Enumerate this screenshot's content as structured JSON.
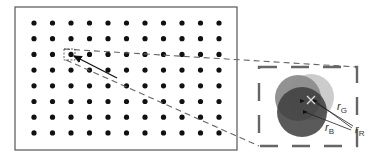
{
  "figure": {
    "type": "chromatic-aberration-spot-diagram",
    "grid": {
      "rows": 8,
      "cols": 11,
      "origin": [
        34,
        23
      ],
      "spacing": [
        18.5,
        15.7
      ],
      "dot_radius": 2.6,
      "dot_color": "#111111",
      "frame": {
        "x": 15,
        "y": 7,
        "width": 222,
        "height": 143,
        "stroke": "#555555"
      }
    },
    "highlight": {
      "box": {
        "x": 64,
        "y": 49,
        "width": 11,
        "height": 11
      },
      "arrow": {
        "from": [
          117,
          78
        ],
        "to": [
          74,
          56
        ]
      }
    },
    "inset": {
      "box": {
        "x": 259,
        "y": 67,
        "width": 98,
        "height": 79,
        "stroke": "#666666"
      },
      "circles": [
        {
          "name": "G",
          "cx": 311,
          "cy": 97,
          "r": 23,
          "fill": "#c9c9c9"
        },
        {
          "name": "R",
          "cx": 298,
          "cy": 98,
          "r": 23,
          "fill": "#8c8c8c"
        },
        {
          "name": "B",
          "cx": 302,
          "cy": 112,
          "r": 25,
          "fill": "#3d3d3d"
        }
      ],
      "labels": [
        {
          "base": "r",
          "sub": "G",
          "x": 337,
          "y": 110
        },
        {
          "base": "r",
          "sub": "R",
          "x": 355,
          "y": 133
        },
        {
          "base": "r",
          "sub": "B",
          "x": 325,
          "y": 131
        }
      ]
    }
  }
}
